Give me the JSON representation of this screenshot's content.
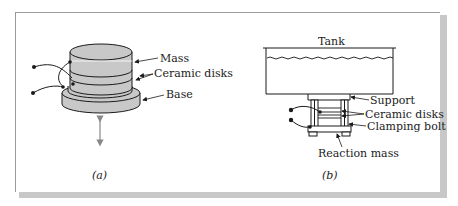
{
  "figure_a": {
    "labels": {
      "mass": "Mass",
      "ceramic_disks": "Ceramic disks",
      "base": "Base"
    },
    "caption": "(a)"
  },
  "figure_b": {
    "labels": {
      "tank": "Tank",
      "support": "Support",
      "ceramic_disks": "Ceramic disks",
      "clamping_bolt": "Clamping bolt",
      "reaction_mass": "Reaction mass"
    },
    "caption": "(b)"
  },
  "colors": {
    "fill": "#c8c8c8",
    "stroke": "#1a1a1a",
    "frame_shadow": "#c8c8c8"
  }
}
